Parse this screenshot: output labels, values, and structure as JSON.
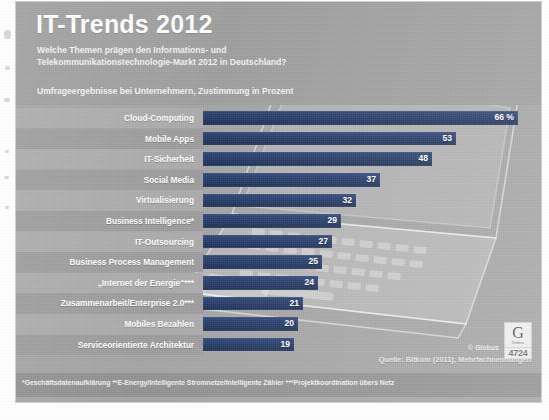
{
  "header": {
    "title": "IT-Trends 2012",
    "subtitle_line1": "Welche Themen prägen den Informations- und",
    "subtitle_line2": "Telekommunikationstechnologie-Markt 2012 in Deutschland?",
    "survey_note": "Umfrageergebnisse bei Unternehmern, Zustimmung in Prozent"
  },
  "chart_data": {
    "type": "bar",
    "title": "IT-Trends 2012",
    "subtitle": "Welche Themen prägen den Informations- und Telekommunikationstechnologie-Markt 2012 in Deutschland?",
    "xlabel": "",
    "ylabel": "",
    "unit": "Prozent",
    "orientation": "horizontal",
    "grid": false,
    "legend": "none",
    "xlim": [
      0,
      66
    ],
    "categories": [
      "Cloud-Computing",
      "Mobile Apps",
      "IT-Sicherheit",
      "Social Media",
      "Virtualisierung",
      "Business Intelligence*",
      "IT-Outsourcing",
      "Business Process Management",
      "„Internet der Energie“***",
      "Zusammenarbeit/Enterprise 2.0***",
      "Mobiles Bezahlen",
      "Serviceorientierte Architektur"
    ],
    "values": [
      66,
      53,
      48,
      37,
      32,
      29,
      27,
      25,
      24,
      21,
      20,
      19
    ],
    "value_labels": [
      "66 %",
      "53",
      "48",
      "37",
      "32",
      "29",
      "27",
      "25",
      "24",
      "21",
      "20",
      "19"
    ],
    "bar_color": "#1f3763",
    "label_color": "#ffffff"
  },
  "rows": [
    {
      "label": "Cloud-Computing",
      "value": 66,
      "value_label": "66 %"
    },
    {
      "label": "Mobile Apps",
      "value": 53,
      "value_label": "53"
    },
    {
      "label": "IT-Sicherheit",
      "value": 48,
      "value_label": "48"
    },
    {
      "label": "Social Media",
      "value": 37,
      "value_label": "37"
    },
    {
      "label": "Virtualisierung",
      "value": 32,
      "value_label": "32"
    },
    {
      "label": "Business Intelligence*",
      "value": 29,
      "value_label": "29"
    },
    {
      "label": "IT-Outsourcing",
      "value": 27,
      "value_label": "27"
    },
    {
      "label": "Business Process Management",
      "value": 25,
      "value_label": "25"
    },
    {
      "label": "„Internet der Energie“***",
      "value": 24,
      "value_label": "24"
    },
    {
      "label": "Zusammenarbeit/Enterprise 2.0***",
      "value": 21,
      "value_label": "21"
    },
    {
      "label": "Mobiles Bezahlen",
      "value": 20,
      "value_label": "20"
    },
    {
      "label": "Serviceorientierte Architektur",
      "value": 19,
      "value_label": "19"
    }
  ],
  "footer": {
    "source": "Quelle: Bitkom (2011); Mehrfachnennungen",
    "globus_credit": "© Globus",
    "globus_letter": "G",
    "globus_word": "Globus",
    "globus_number": "4724",
    "footnote": "*Geschäftsdatenaufklärung  **E-Energy/Intelligente Stromnetze/Intelligente Zähler  ***Projektkoordination übers Netz"
  },
  "colors": {
    "panel_bg": "#a3a3a3",
    "header_bg": "#9c9c9c",
    "bar": "#1f3763",
    "row_light": "#a9a9a9",
    "row_dark": "#9a9a9a",
    "text_light": "#ffffff"
  }
}
